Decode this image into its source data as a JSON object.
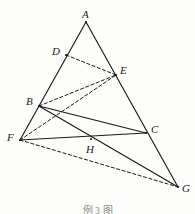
{
  "figure": {
    "caption": "例 3 图",
    "width": 195,
    "height": 214,
    "background_color": "#fdfdfb",
    "stroke_color": "#1a1a1a",
    "points": [
      {
        "id": "A",
        "label": "A",
        "x": 86,
        "y": 22,
        "label_x": 82,
        "label_y": 9
      },
      {
        "id": "D",
        "label": "D",
        "x": 66,
        "y": 55,
        "label_x": 52,
        "label_y": 46
      },
      {
        "id": "E",
        "label": "E",
        "x": 116,
        "y": 75,
        "label_x": 120,
        "label_y": 65
      },
      {
        "id": "B",
        "label": "B",
        "x": 39,
        "y": 106,
        "label_x": 26,
        "label_y": 96
      },
      {
        "id": "C",
        "label": "C",
        "x": 146,
        "y": 133,
        "label_x": 151,
        "label_y": 124
      },
      {
        "id": "F",
        "label": "F",
        "x": 20,
        "y": 140,
        "label_x": 7,
        "label_y": 132
      },
      {
        "id": "H",
        "label": "H",
        "x": 91,
        "y": 139,
        "label_x": 86,
        "label_y": 144
      },
      {
        "id": "G",
        "label": "G",
        "x": 178,
        "y": 187,
        "label_x": 182,
        "label_y": 183
      }
    ],
    "segments": [
      {
        "id": "A-F",
        "from": "A",
        "to": "F",
        "style": "solid",
        "name": "segment-A-F-through-D-B"
      },
      {
        "id": "A-G",
        "from": "A",
        "to": "G",
        "style": "solid",
        "name": "segment-A-G-through-E-C"
      },
      {
        "id": "B-C",
        "from": "B",
        "to": "C",
        "style": "solid",
        "name": "segment-B-C"
      },
      {
        "id": "B-G",
        "from": "B",
        "to": "G",
        "style": "solid",
        "name": "segment-B-G-through-H"
      },
      {
        "id": "F-C",
        "from": "F",
        "to": "C",
        "style": "solid",
        "name": "segment-F-C-through-H"
      },
      {
        "id": "F-E",
        "from": "F",
        "to": "E",
        "style": "dashed",
        "name": "segment-F-E"
      },
      {
        "id": "B-E",
        "from": "B",
        "to": "E",
        "style": "dashed",
        "name": "segment-B-E"
      },
      {
        "id": "D-E",
        "from": "D",
        "to": "E",
        "style": "dashed",
        "name": "segment-D-E"
      },
      {
        "id": "F-G",
        "from": "F",
        "to": "G",
        "style": "dashed",
        "name": "segment-F-G"
      }
    ]
  }
}
